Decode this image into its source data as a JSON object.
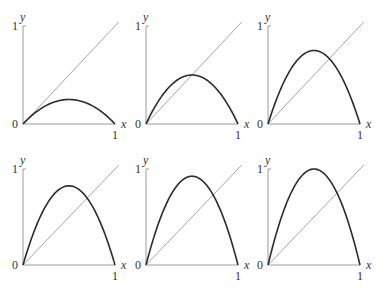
{
  "chart_data": [
    {
      "type": "line",
      "panel": 1,
      "r": 1.0,
      "title": "",
      "xlabel": "x",
      "ylabel": "y",
      "x_ticks": [
        "0",
        "1"
      ],
      "y_ticks": [
        "0",
        "1"
      ],
      "xlim": [
        0,
        1
      ],
      "ylim": [
        0,
        1
      ],
      "series": [
        {
          "name": "f(x) = r x (1 - x)",
          "r": 1.0,
          "peak": 0.25
        },
        {
          "name": "y = x"
        }
      ]
    },
    {
      "type": "line",
      "panel": 2,
      "r": 2.0,
      "title": "",
      "xlabel": "x",
      "ylabel": "y",
      "x_ticks": [
        "0",
        "1"
      ],
      "y_ticks": [
        "0",
        "1"
      ],
      "xlim": [
        0,
        1
      ],
      "ylim": [
        0,
        1
      ],
      "series": [
        {
          "name": "f(x) = r x (1 - x)",
          "r": 2.0,
          "peak": 0.5
        },
        {
          "name": "y = x"
        }
      ]
    },
    {
      "type": "line",
      "panel": 3,
      "r": 3.0,
      "title": "",
      "xlabel": "x",
      "ylabel": "y",
      "x_ticks": [
        "0",
        "1"
      ],
      "y_ticks": [
        "0",
        "1"
      ],
      "xlim": [
        0,
        1
      ],
      "ylim": [
        0,
        1
      ],
      "series": [
        {
          "name": "f(x) = r x (1 - x)",
          "r": 3.0,
          "peak": 0.75
        },
        {
          "name": "y = x"
        }
      ]
    },
    {
      "type": "line",
      "panel": 4,
      "r": 3.3,
      "title": "",
      "xlabel": "x",
      "ylabel": "y",
      "x_ticks": [
        "0",
        "1"
      ],
      "y_ticks": [
        "0",
        "1"
      ],
      "xlim": [
        0,
        1
      ],
      "ylim": [
        0,
        1
      ],
      "series": [
        {
          "name": "f(x) = r x (1 - x)",
          "r": 3.3,
          "peak": 0.825
        },
        {
          "name": "y = x"
        }
      ]
    },
    {
      "type": "line",
      "panel": 5,
      "r": 3.7,
      "title": "",
      "xlabel": "x",
      "ylabel": "y",
      "x_ticks": [
        "0",
        "1"
      ],
      "y_ticks": [
        "0",
        "1"
      ],
      "xlim": [
        0,
        1
      ],
      "ylim": [
        0,
        1
      ],
      "series": [
        {
          "name": "f(x) = r x (1 - x)",
          "r": 3.7,
          "peak": 0.925
        },
        {
          "name": "y = x"
        }
      ]
    },
    {
      "type": "line",
      "panel": 6,
      "r": 4.0,
      "title": "",
      "xlabel": "x",
      "ylabel": "y",
      "x_ticks": [
        "0",
        "1"
      ],
      "y_ticks": [
        "0",
        "1"
      ],
      "xlim": [
        0,
        1
      ],
      "ylim": [
        0,
        1
      ],
      "series": [
        {
          "name": "f(x) = r x (1 - x)",
          "r": 4.0,
          "peak": 1.0
        },
        {
          "name": "y = x"
        }
      ]
    }
  ],
  "layout": {
    "panels": [
      {
        "ox": 23,
        "oy": 124,
        "w": 92,
        "h": 98
      },
      {
        "ox": 146,
        "oy": 124,
        "w": 92,
        "h": 98
      },
      {
        "ox": 268,
        "oy": 124,
        "w": 92,
        "h": 98
      },
      {
        "ox": 23,
        "oy": 265,
        "w": 92,
        "h": 96
      },
      {
        "ox": 146,
        "oy": 265,
        "w": 92,
        "h": 96
      },
      {
        "ox": 268,
        "oy": 265,
        "w": 92,
        "h": 96
      }
    ],
    "diag_extent": 1.04
  },
  "colors": {
    "curve": "#2b2b2b",
    "diagonal": "#9a9a9a",
    "axis": "#9a9a9a",
    "label": "#333333"
  }
}
